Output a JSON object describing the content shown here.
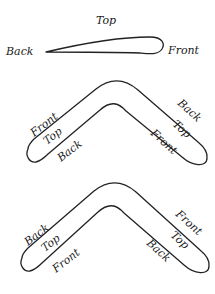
{
  "airfoil": {
    "top": "Top",
    "back": "Back",
    "front": "Front"
  },
  "boomerang_1": {
    "left_outer": "Front",
    "left_middle": "Top",
    "left_inner": "Back",
    "right_outer": "Back",
    "right_middle": "Top",
    "right_inner": "Front"
  },
  "boomerang_2": {
    "left_outer": "Back",
    "left_middle": "Top",
    "left_inner": "Front",
    "right_outer": "Front",
    "right_middle": "Top",
    "right_inner": "Back"
  }
}
